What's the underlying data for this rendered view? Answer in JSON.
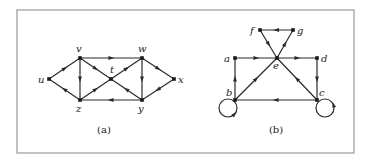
{
  "figure": {
    "frame": {
      "x": 17,
      "y": 10,
      "w": 337,
      "h": 143
    },
    "panels": [
      {
        "id": "a",
        "caption": "(a)",
        "caption_pos": [
          104,
          133
        ],
        "nodes": [
          {
            "id": "u",
            "label": "u",
            "x": 49,
            "y": 79,
            "lx": 38,
            "ly": 83
          },
          {
            "id": "v",
            "label": "v",
            "x": 80,
            "y": 58,
            "lx": 76,
            "ly": 52
          },
          {
            "id": "w",
            "label": "w",
            "x": 142,
            "y": 58,
            "lx": 138,
            "ly": 52
          },
          {
            "id": "x",
            "label": "x",
            "x": 174,
            "y": 79,
            "lx": 178,
            "ly": 83
          },
          {
            "id": "z",
            "label": "z",
            "x": 80,
            "y": 100,
            "lx": 76,
            "ly": 112
          },
          {
            "id": "y",
            "label": "y",
            "x": 142,
            "y": 100,
            "lx": 138,
            "ly": 112
          },
          {
            "id": "t",
            "label": "t",
            "x": 111,
            "y": 79,
            "lx": 110,
            "ly": 73
          }
        ],
        "edges": [
          {
            "from": "u",
            "to": "v"
          },
          {
            "from": "z",
            "to": "u"
          },
          {
            "from": "v",
            "to": "w"
          },
          {
            "from": "v",
            "to": "z"
          },
          {
            "from": "v",
            "to": "t"
          },
          {
            "from": "t",
            "to": "w"
          },
          {
            "from": "z",
            "to": "t"
          },
          {
            "from": "y",
            "to": "t"
          },
          {
            "from": "w",
            "to": "y"
          },
          {
            "from": "w",
            "to": "x"
          },
          {
            "from": "x",
            "to": "y"
          },
          {
            "from": "y",
            "to": "z"
          }
        ],
        "loops": []
      },
      {
        "id": "b",
        "caption": "(b)",
        "caption_pos": [
          276,
          133
        ],
        "nodes": [
          {
            "id": "f",
            "label": "f",
            "x": 260,
            "y": 30,
            "lx": 250,
            "ly": 34
          },
          {
            "id": "g",
            "label": "g",
            "x": 293,
            "y": 30,
            "lx": 297,
            "ly": 34
          },
          {
            "id": "a",
            "label": "a",
            "x": 235,
            "y": 58,
            "lx": 224,
            "ly": 62
          },
          {
            "id": "e",
            "label": "e",
            "x": 277,
            "y": 58,
            "lx": 273,
            "ly": 69
          },
          {
            "id": "d",
            "label": "d",
            "x": 317,
            "y": 58,
            "lx": 321,
            "ly": 62
          },
          {
            "id": "b",
            "label": "b",
            "x": 235,
            "y": 100,
            "lx": 226,
            "ly": 96
          },
          {
            "id": "c",
            "label": "c",
            "x": 317,
            "y": 100,
            "lx": 319,
            "ly": 96
          }
        ],
        "edges": [
          {
            "from": "g",
            "to": "f"
          },
          {
            "from": "f",
            "to": "e"
          },
          {
            "from": "e",
            "to": "g"
          },
          {
            "from": "a",
            "to": "e"
          },
          {
            "from": "e",
            "to": "d"
          },
          {
            "from": "d",
            "to": "c"
          },
          {
            "from": "c",
            "to": "e"
          },
          {
            "from": "b",
            "to": "e"
          },
          {
            "from": "b",
            "to": "a"
          },
          {
            "from": "c",
            "to": "b"
          }
        ],
        "loops": [
          {
            "node": "b",
            "cx": 228,
            "cy": 108,
            "r": 9,
            "arrow_angle": 45
          },
          {
            "node": "c",
            "cx": 325,
            "cy": 108,
            "r": 9,
            "arrow_angle": -20
          }
        ]
      }
    ]
  },
  "colors": {
    "ink": "#2a2a2a",
    "frame": "#9a9a9a",
    "background": "#ffffff"
  }
}
